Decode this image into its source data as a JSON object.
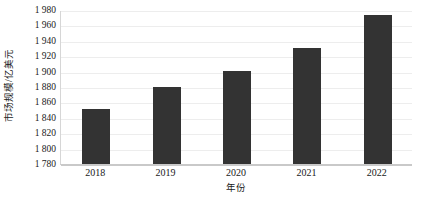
{
  "chart_data": {
    "type": "bar",
    "title": "",
    "subtitle": "",
    "xlabel": "年份",
    "ylabel": "市场规模/亿美元",
    "categories": [
      "2018",
      "2019",
      "2020",
      "2021",
      "2022"
    ],
    "values": [
      1851,
      1880,
      1901,
      1931,
      1973
    ],
    "series": [
      {
        "name": "市场规模",
        "values": [
          1851,
          1880,
          1901,
          1931,
          1973
        ]
      }
    ],
    "ylim": [
      1780,
      1980
    ],
    "ytick_step": 20,
    "ytick_labels": [
      "1 980",
      "1 960",
      "1 940",
      "1 920",
      "1 900",
      "1 880",
      "1 860",
      "1 840",
      "1 820",
      "1 800",
      "1 780"
    ],
    "ytick_values": [
      1980,
      1960,
      1940,
      1920,
      1900,
      1880,
      1860,
      1840,
      1820,
      1800,
      1780
    ],
    "grid": true,
    "grid_axis": "y",
    "legend": false,
    "legend_position": "none",
    "bar_color": "#333333",
    "gridline_color": "#ededed",
    "axis_color": "#c9c9c9",
    "background_color": "#ffffff",
    "annotations": []
  }
}
